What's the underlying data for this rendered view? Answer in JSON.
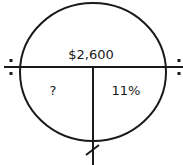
{
  "diagram": {
    "type": "percent-circle",
    "top_label": "$2,600",
    "bottom_left_label": "?",
    "bottom_right_label": "11%",
    "left_operator": "÷",
    "right_operator": "÷",
    "bottom_operator": "×",
    "stroke_color": "#1a1a1a"
  }
}
